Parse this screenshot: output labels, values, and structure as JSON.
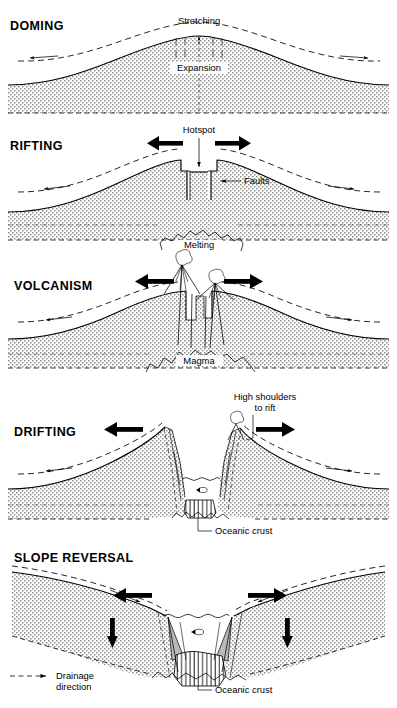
{
  "figure": {
    "width": 397,
    "height": 708,
    "background": "#ffffff",
    "ink": "#000000",
    "stipple_color": "#9a9a9a",
    "shade_color": "#b9b9b9"
  },
  "panels": [
    {
      "id": "doming",
      "title": "DOMING",
      "title_xy": [
        10,
        30
      ],
      "labels": [
        {
          "name": "stretching-label",
          "text": "Stretching",
          "x": 199,
          "y": 24,
          "anchor": "middle"
        },
        {
          "name": "expansion-label",
          "text": "Expansion",
          "x": 199,
          "y": 70,
          "anchor": "middle"
        }
      ],
      "features": [
        "domed-crust",
        "dashed-original-surface",
        "drainage-arrows-outward",
        "stretching-tick-marks",
        "expansion-axis-line",
        "stipple-mantle"
      ]
    },
    {
      "id": "rifting",
      "title": "RIFTING",
      "title_xy": [
        10,
        150
      ],
      "labels": [
        {
          "name": "hotspot-label",
          "text": "Hotspot",
          "x": 199,
          "y": 133,
          "anchor": "middle"
        },
        {
          "name": "faults-label",
          "text": "Faults",
          "x": 244,
          "y": 184,
          "anchor": "start"
        },
        {
          "name": "melting-label",
          "text": "Melting",
          "x": 199,
          "y": 246,
          "anchor": "middle"
        }
      ],
      "features": [
        "rift-graben",
        "normal-faults",
        "hotspot-arrow",
        "spreading-arrows",
        "melting-lens",
        "dashed-original-surface",
        "stipple-mantle"
      ]
    },
    {
      "id": "volcanism",
      "title": "VOLCANISM",
      "title_xy": [
        14,
        290
      ],
      "labels": [
        {
          "name": "magma-label",
          "text": "Magma",
          "x": 199,
          "y": 363,
          "anchor": "middle"
        }
      ],
      "features": [
        "two-volcanoes",
        "eruption-plumes",
        "magma-chamber",
        "feeder-dykes",
        "spreading-arrows",
        "dashed-original-surface",
        "stipple-mantle"
      ]
    },
    {
      "id": "drifting",
      "title": "DRIFTING",
      "title_xy": [
        14,
        436
      ],
      "labels": [
        {
          "name": "high-shoulders-label-line1",
          "text": "High shoulders",
          "x": 265,
          "y": 400,
          "anchor": "middle"
        },
        {
          "name": "high-shoulders-label-line2",
          "text": "to rift",
          "x": 265,
          "y": 411,
          "anchor": "middle"
        },
        {
          "name": "oceanic-crust-label",
          "text": "Oceanic crust",
          "x": 215,
          "y": 534,
          "anchor": "start"
        }
      ],
      "features": [
        "rift-valley-flooded",
        "sea-water-surface",
        "fish-marker",
        "oceanic-crust-hatched",
        "rift-flank-faults",
        "volcano-remnant",
        "spreading-arrows",
        "dashed-original-surface",
        "stipple-mantle"
      ]
    },
    {
      "id": "slope-reversal",
      "title": "SLOPE REVERSAL",
      "title_xy": [
        14,
        562
      ],
      "labels": [
        {
          "name": "oceanic-crust-label",
          "text": "Oceanic crust",
          "x": 215,
          "y": 693,
          "anchor": "start"
        }
      ],
      "features": [
        "reversed-margin-slopes",
        "subsiding-arrows-down",
        "sea-water-surface",
        "fish-marker",
        "oceanic-crust-hatched",
        "sediment-wedges",
        "spreading-arrows",
        "dashed-drainage-reversed",
        "stipple-mantle"
      ]
    }
  ],
  "legend": {
    "name": "drainage-legend",
    "swatch": "dashed-line-with-arrow",
    "line1": "Drainage",
    "line2": "direction",
    "x": 10,
    "y": 676
  }
}
